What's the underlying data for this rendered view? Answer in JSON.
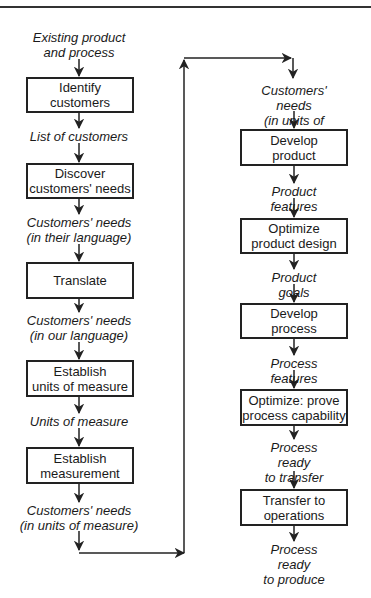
{
  "diagram": {
    "type": "flowchart",
    "left_column": {
      "start_label": "Existing product\nand process",
      "steps": [
        {
          "box": "Identify\ncustomers",
          "output": "List of customers"
        },
        {
          "box": "Discover\ncustomers' needs",
          "output": "Customers' needs\n(in their language)"
        },
        {
          "box": "Translate",
          "output": "Customers' needs\n(in our language)"
        },
        {
          "box": "Establish\nunits of measure",
          "output": "Units of measure"
        },
        {
          "box": "Establish\nmeasurement",
          "output": "Customers' needs\n(in units of measure)"
        }
      ]
    },
    "right_column": {
      "start_label": "Customers' needs\n(in units of measure)",
      "steps": [
        {
          "box": "Develop\nproduct",
          "output": "Product features"
        },
        {
          "box": "Optimize\nproduct design",
          "output": "Product goals"
        },
        {
          "box": "Develop\nprocess",
          "output": "Process features"
        },
        {
          "box": "Optimize: prove\nprocess capability",
          "output": "Process ready\nto transfer"
        },
        {
          "box": "Transfer to\noperations",
          "output": "Process ready\nto produce"
        }
      ]
    },
    "colors": {
      "line": "#222222",
      "background": "#ffffff"
    }
  }
}
